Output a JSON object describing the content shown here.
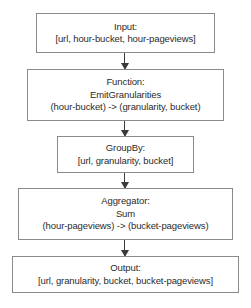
{
  "diagram": {
    "type": "flowchart",
    "orientation": "vertical-top-to-bottom",
    "colors": {
      "background": "#ffffff",
      "box_border": "#8a8a8a",
      "text": "#2b2b2b",
      "arrow": "#3a3a3a"
    },
    "nodes": [
      {
        "id": "input",
        "lines": [
          "Input:",
          "[url, hour-bucket, hour-pageviews]"
        ]
      },
      {
        "id": "function",
        "lines": [
          "Function:",
          "EmitGranularities",
          "(hour-bucket) -> (granularity, bucket)"
        ]
      },
      {
        "id": "groupby",
        "lines": [
          "GroupBy:",
          "[url, granularity, bucket]"
        ]
      },
      {
        "id": "aggregator",
        "lines": [
          "Aggregator:",
          "Sum",
          "(hour-pageviews) -> (bucket-pageviews)"
        ]
      },
      {
        "id": "output",
        "lines": [
          "Output:",
          "[url, granularity, bucket, bucket-pageviews]"
        ]
      }
    ],
    "edges": [
      {
        "id": "edge-input-function",
        "from": "input",
        "to": "function",
        "style": "solid-arrow-down"
      },
      {
        "id": "edge-function-groupby",
        "from": "function",
        "to": "groupby",
        "style": "solid-arrow-down"
      },
      {
        "id": "edge-groupby-aggregator",
        "from": "groupby",
        "to": "aggregator",
        "style": "solid-arrow-down"
      },
      {
        "id": "edge-aggregator-output",
        "from": "aggregator",
        "to": "output",
        "style": "solid-arrow-down"
      }
    ]
  }
}
